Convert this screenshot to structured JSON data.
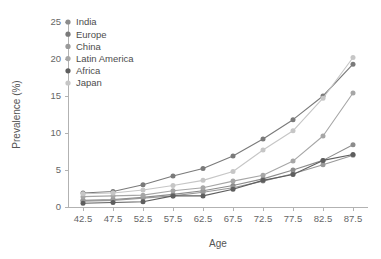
{
  "chart_data": {
    "type": "line",
    "title": "",
    "xlabel": "Age",
    "ylabel": "Prevalence (%)",
    "x": [
      42.5,
      47.5,
      52.5,
      57.5,
      62.5,
      67.5,
      72.5,
      77.5,
      82.5,
      87.5
    ],
    "xtick_labels": [
      "42.5",
      "47.5",
      "52.5",
      "57.5",
      "62.5",
      "67.5",
      "72.5",
      "77.5",
      "82.5",
      "87.5"
    ],
    "ytick_labels": [
      "0",
      "5",
      "10",
      "15",
      "20",
      "25"
    ],
    "yticks": [
      0,
      5,
      10,
      15,
      20,
      25
    ],
    "xlim": [
      40.0,
      90.0
    ],
    "ylim": [
      0,
      25
    ],
    "grid": false,
    "legend_position": "top-left",
    "markers": "circle",
    "series": [
      {
        "name": "India",
        "color": "#8c8c8c",
        "values": [
          0.9,
          1.0,
          1.3,
          1.7,
          2.2,
          2.9,
          3.8,
          5.0,
          6.3,
          8.4
        ]
      },
      {
        "name": "Europe",
        "color": "#7a7a7a",
        "values": [
          1.9,
          2.1,
          3.0,
          4.2,
          5.2,
          6.9,
          9.2,
          11.8,
          15.0,
          19.3
        ]
      },
      {
        "name": "China",
        "color": "#999999",
        "values": [
          0.8,
          0.9,
          1.2,
          1.5,
          2.0,
          2.6,
          3.5,
          4.5,
          5.7,
          7.0
        ]
      },
      {
        "name": "Latin America",
        "color": "#a6a6a6",
        "values": [
          1.4,
          1.5,
          1.6,
          2.2,
          2.6,
          3.5,
          4.3,
          6.2,
          9.6,
          15.4
        ]
      },
      {
        "name": "Africa",
        "color": "#5e5e5e",
        "values": [
          0.5,
          0.6,
          0.7,
          1.5,
          1.5,
          2.4,
          3.6,
          4.4,
          6.3,
          7.1
        ]
      },
      {
        "name": "Japan",
        "color": "#c6c6c6",
        "values": [
          1.8,
          1.9,
          2.3,
          2.9,
          3.6,
          4.8,
          7.7,
          10.3,
          14.7,
          20.2
        ]
      }
    ]
  },
  "axes": {
    "x_title": "Age",
    "y_title": "Prevalence (%)"
  },
  "colors": {
    "axis": "#b2b2b2",
    "tick_text": "#666666",
    "legend_text": "#4d4d4d",
    "background": "#ffffff"
  }
}
